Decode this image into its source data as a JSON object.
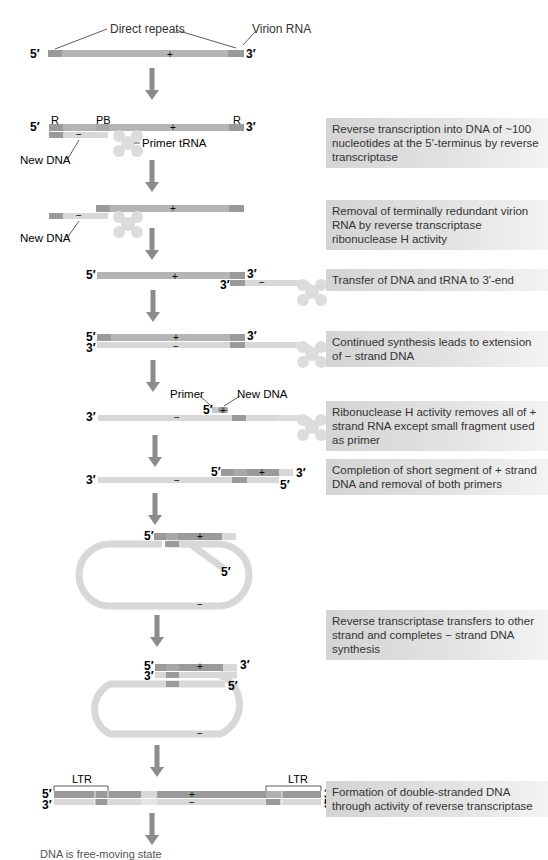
{
  "diagram": {
    "labels": {
      "direct_repeats": "Direct repeats",
      "virion_rna": "Virion RNA",
      "r": "R",
      "pb": "PB",
      "new_dna": "New DNA",
      "primer_trna": "Primer tRNA",
      "primer": "Primer",
      "ltr": "LTR",
      "five_prime": "5′",
      "three_prime": "3′",
      "plus": "+",
      "minus": "−"
    },
    "steps": [
      {
        "id": 1,
        "text": "Reverse transcription into DNA of ~100 nucleotides at the 5′-terminus by reverse transcriptase"
      },
      {
        "id": 2,
        "text": "Removal of terminally redundant virion RNA by reverse transcriptase ribonuclease H activity"
      },
      {
        "id": 3,
        "text": "Transfer of DNA and tRNA to 3′-end"
      },
      {
        "id": 4,
        "text": "Continued synthesis leads to extension of − strand DNA"
      },
      {
        "id": 5,
        "text": "Ribonuclease H activity removes all of + strand RNA except small fragment used as primer"
      },
      {
        "id": 6,
        "text": "Completion of short segment of + strand DNA and removal of both primers"
      },
      {
        "id": 7,
        "text": "Reverse transcriptase transfers to other strand and completes − strand DNA synthesis"
      },
      {
        "id": 8,
        "text": "Formation of double-stranded DNA through activity of reverse transcriptase"
      }
    ],
    "bottom_caption_fragment": "DNA is free-moving state",
    "colors": {
      "rna_strand": "#b5b5b5",
      "dark_segment": "#9a9a9a",
      "light_strand": "#d8d8d8",
      "arrow": "#8c8c8c",
      "trna": "#dcdcdc",
      "box_bg": "#d9d9d9"
    }
  }
}
